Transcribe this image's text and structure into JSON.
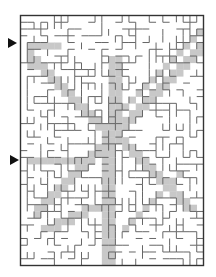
{
  "puzzle": {
    "type": "maze",
    "grid": {
      "cols": 27,
      "rows": 37,
      "cell": 6.78,
      "origin_x": 20,
      "origin_y": 15
    },
    "colors": {
      "wall": "#555555",
      "border": "#333333",
      "path": "#c8c8c8",
      "background": "#ffffff",
      "arrow": "#111111"
    },
    "entrances": [
      {
        "name": "upper-entrance",
        "x": 8,
        "y": 38
      },
      {
        "name": "lower-entrance",
        "x": 10,
        "y": 155
      }
    ]
  }
}
